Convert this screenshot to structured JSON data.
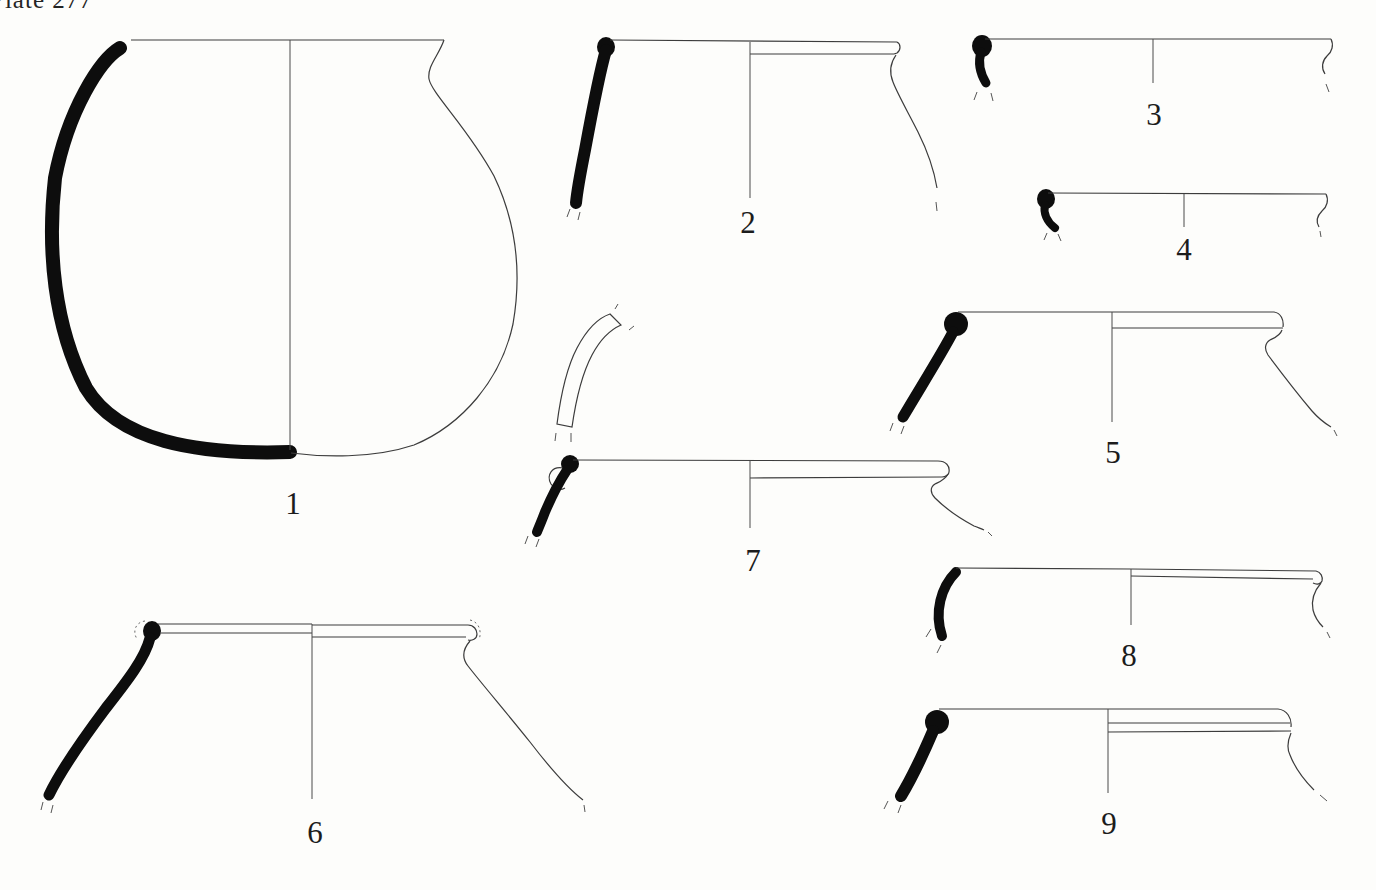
{
  "page": {
    "background": "#fdfdfb",
    "ink": "#0d0d0d",
    "line_color": "#3c3c3c"
  },
  "header": {
    "plate_label": "Plate 277"
  },
  "figures": [
    {
      "name": "vessel-1",
      "label": "1"
    },
    {
      "name": "vessel-2",
      "label": "2"
    },
    {
      "name": "vessel-3",
      "label": "3"
    },
    {
      "name": "vessel-4",
      "label": "4"
    },
    {
      "name": "vessel-5",
      "label": "5"
    },
    {
      "name": "vessel-6",
      "label": "6"
    },
    {
      "name": "vessel-7",
      "label": "7"
    },
    {
      "name": "vessel-8",
      "label": "8"
    },
    {
      "name": "vessel-9",
      "label": "9"
    },
    {
      "name": "body-sherd-fragment",
      "label": ""
    }
  ]
}
